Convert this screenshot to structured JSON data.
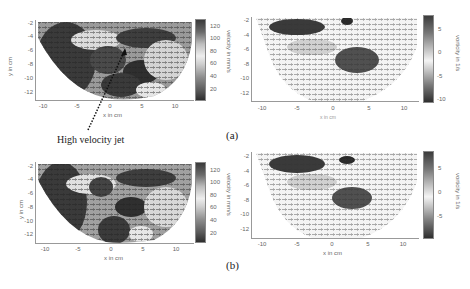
{
  "figure": {
    "panel_labels": [
      "(a)",
      "(b)"
    ],
    "annotation": {
      "text": "High velocity jet",
      "arrow": "dotted-arrow-pointing-up-right"
    }
  },
  "plots": [
    {
      "id": "a-velocity",
      "xlabel": "x in cm",
      "ylabel": "y in cm",
      "xticks": [
        "-10",
        "-5",
        "0",
        "5",
        "10"
      ],
      "yticks": [
        "-2",
        "-4",
        "-6",
        "-8",
        "-10",
        "-12"
      ],
      "colorbar": {
        "label": "velocity in mm/s",
        "ticks": [
          "120",
          "100",
          "80",
          "60",
          "40",
          "20"
        ]
      }
    },
    {
      "id": "a-vorticity",
      "xlabel": "x in cm",
      "ylabel": "y in cm",
      "xticks": [
        "-10",
        "-5",
        "0",
        "5",
        "10"
      ],
      "yticks": [
        "-2",
        "-4",
        "-6",
        "-8",
        "-10",
        "-12"
      ],
      "colorbar": {
        "label": "vorticity in 1/s",
        "ticks": [
          "5",
          "0",
          "-5",
          "-10"
        ]
      }
    },
    {
      "id": "b-velocity",
      "xlabel": "x in cm",
      "ylabel": "y in cm",
      "xticks": [
        "-10",
        "-5",
        "0",
        "5",
        "10"
      ],
      "yticks": [
        "-2",
        "-4",
        "-6",
        "-8",
        "-10",
        "-12"
      ],
      "colorbar": {
        "label": "velocity in mm/s",
        "ticks": [
          "120",
          "100",
          "80",
          "60",
          "40",
          "20"
        ]
      }
    },
    {
      "id": "b-vorticity",
      "xlabel": "x in cm",
      "ylabel": "y in cm",
      "xticks": [
        "-10",
        "-5",
        "0",
        "5",
        "10"
      ],
      "yticks": [
        "-2",
        "-4",
        "-6",
        "-8",
        "-10",
        "-12"
      ],
      "colorbar": {
        "label": "vorticity in 1/s",
        "ticks": [
          "5",
          "0",
          "-5"
        ]
      }
    }
  ],
  "colors": {
    "background": "#ffffff",
    "axis": "#999999",
    "tick_text": "#666666",
    "field_dark": "#333333",
    "field_light": "#eeeeee"
  }
}
